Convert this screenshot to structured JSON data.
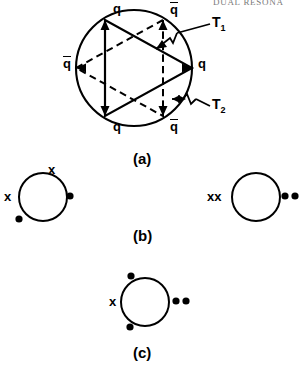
{
  "page": {
    "running_head": "DUAL RESONA",
    "width": 303,
    "height": 374,
    "background": "#ffffff",
    "ink": "#000000"
  },
  "figure": {
    "type": "duality-diagram",
    "panels": [
      {
        "id": "a",
        "caption": "(a)"
      },
      {
        "id": "b",
        "caption": "(b)"
      },
      {
        "id": "c",
        "caption": "(c)"
      }
    ]
  },
  "panel_a": {
    "caption": "(a)",
    "circle": {
      "cx": 134,
      "cy": 68,
      "r": 58
    },
    "description": "Circle with two overlapping triangles forming a six-point star; alternating quark and antiquark legs",
    "vertex_labels": [
      {
        "name": "top-left-quark",
        "text": "q",
        "bar": false,
        "x": 113,
        "y": 2,
        "angle_deg": 120
      },
      {
        "name": "top-right-antiquark",
        "text": "q",
        "bar": true,
        "x": 171,
        "y": 2,
        "angle_deg": 60
      },
      {
        "name": "left-antiquark",
        "text": "q",
        "bar": true,
        "x": 64,
        "y": 62,
        "angle_deg": 180
      },
      {
        "name": "right-quark",
        "text": "q",
        "bar": false,
        "x": 199,
        "y": 62,
        "angle_deg": 0
      },
      {
        "name": "bottom-left-quark",
        "text": "q",
        "bar": false,
        "x": 113,
        "y": 130,
        "angle_deg": 240
      },
      {
        "name": "bottom-right-antiquark",
        "text": "q",
        "bar": true,
        "x": 171,
        "y": 130,
        "angle_deg": 300
      }
    ],
    "channel_labels": [
      {
        "name": "channel-t1",
        "text": "T",
        "sub": "1",
        "x": 214,
        "y": 18
      },
      {
        "name": "channel-t2",
        "text": "T",
        "sub": "2",
        "x": 214,
        "y": 101
      }
    ],
    "solid_triangle_vertices": "top-left-quark, right-quark, bottom-left-quark",
    "dashed_triangle_vertices": "top-right-antiquark, left-antiquark, bottom-right-antiquark"
  },
  "panel_b": {
    "caption": "(b)",
    "caption_x": 136,
    "caption_y": 235,
    "diagrams": [
      {
        "name": "left-diagram",
        "circle": {
          "cx": 43,
          "cy": 197,
          "r": 24
        },
        "marks": [
          {
            "name": "cross-top",
            "glyph": "x",
            "type": "cross",
            "x": 51,
            "y": 165
          },
          {
            "name": "cross-left",
            "glyph": "x",
            "type": "cross",
            "x": 5,
            "y": 191
          },
          {
            "name": "dot-right",
            "glyph": "•",
            "type": "dot",
            "x": 67,
            "y": 191
          },
          {
            "name": "dot-bottom-left",
            "glyph": "•",
            "type": "dot",
            "x": 15,
            "y": 215
          }
        ]
      },
      {
        "name": "right-diagram",
        "circle": {
          "cx": 256,
          "cy": 197,
          "r": 24
        },
        "marks": [
          {
            "name": "cross-pair-left",
            "glyph": "xx",
            "type": "cross-pair",
            "x": 209,
            "y": 191
          },
          {
            "name": "dot-pair-right",
            "glyph": "••",
            "type": "dot-pair",
            "x": 282,
            "y": 191
          }
        ]
      }
    ]
  },
  "panel_c": {
    "caption": "(c)",
    "caption_x": 136,
    "caption_y": 352,
    "diagrams": [
      {
        "name": "center-diagram",
        "circle": {
          "cx": 145,
          "cy": 302,
          "r": 24
        },
        "marks": [
          {
            "name": "dot-top-left",
            "glyph": "•",
            "type": "dot",
            "x": 128,
            "y": 270
          },
          {
            "name": "cross-left",
            "glyph": "x",
            "type": "cross",
            "x": 110,
            "y": 296
          },
          {
            "name": "dot-pair-right",
            "glyph": "••",
            "type": "dot-pair",
            "x": 172,
            "y": 296
          },
          {
            "name": "dot-bottom-left",
            "glyph": "•",
            "type": "dot",
            "x": 126,
            "y": 322
          }
        ]
      }
    ]
  }
}
